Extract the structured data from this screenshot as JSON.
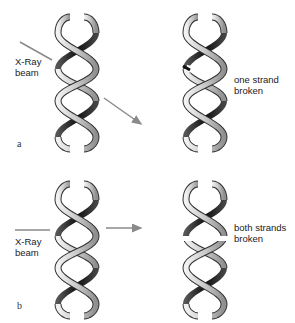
{
  "panels": [
    {
      "id": "a",
      "letter": "a",
      "beam_label_line1": "X-Ray",
      "beam_label_line2": "beam",
      "result_line1": "one strand",
      "result_line2": "broken",
      "beam_direction": "diagonal"
    },
    {
      "id": "b",
      "letter": "b",
      "beam_label_line1": "X-Ray",
      "beam_label_line2": "beam",
      "result_line1": "both strands",
      "result_line2": "broken",
      "beam_direction": "horizontal"
    }
  ],
  "colors": {
    "beam": "#8a8a8a",
    "ribbon_dark": "#1a1a1a",
    "ribbon_light": "#d8d8d8",
    "ribbon_edge": "#3a3a3a",
    "text": "#222222"
  }
}
